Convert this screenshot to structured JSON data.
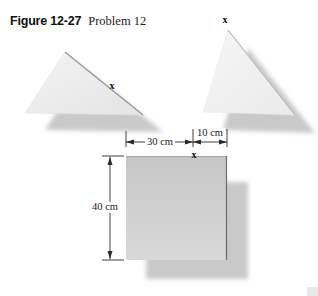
{
  "figure": {
    "figure_label": "Figure 12-27",
    "problem_label": "Problem 12"
  },
  "dimensions": {
    "width_30": "30 cm",
    "width_10": "10 cm",
    "height_40": "40 cm"
  },
  "point_markers": {
    "left_triangle_x": "x",
    "right_triangle_x": "x",
    "square_x": "x"
  },
  "colors": {
    "background": "#ffffff",
    "shadow": "#c9c9c9",
    "left_triangle_fill": "#ececec",
    "right_triangle_fill": "#f2f2f2",
    "square_fill_top": "#c6c6c6",
    "square_fill_bottom": "#d9d9d9",
    "triangle_edge": "#9a9a9a",
    "square_right_edge": "#6b6b6b",
    "dimension_line": "#2b2b2b",
    "text": "#1a1a1a"
  }
}
